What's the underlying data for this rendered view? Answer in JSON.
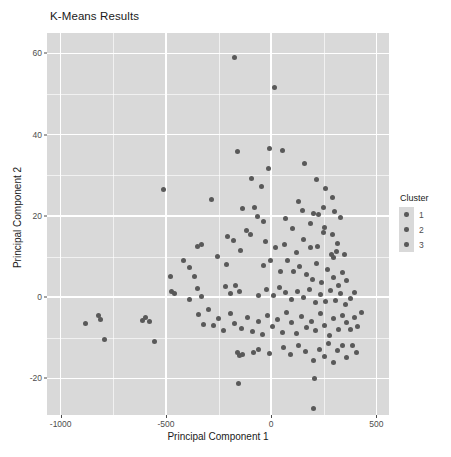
{
  "chart_data": {
    "type": "scatter",
    "title": "K-Means Results",
    "xlabel": "Principal Component 1",
    "ylabel": "Principal Component 2",
    "xlim": [
      -1065,
      560
    ],
    "ylim": [
      -29,
      65
    ],
    "x_ticks": [
      -1000,
      -500,
      0,
      500
    ],
    "x_tick_labels": [
      "-1000",
      "-500",
      "0",
      "500"
    ],
    "y_ticks": [
      -20,
      0,
      20,
      40,
      60
    ],
    "y_tick_labels": [
      "-20",
      "0",
      "20",
      "40",
      "60"
    ],
    "x_minor_ticks": [
      -750,
      -250,
      250
    ],
    "y_minor_ticks": [
      -10,
      10,
      30,
      50
    ],
    "grid": true,
    "legend_position": "right",
    "panel_background": "#d9d9d9",
    "grid_color": "#ffffff",
    "point_color": "#595959",
    "series": [
      {
        "name": "Cluster",
        "points": [
          [
            -172,
            59.0
          ],
          [
            15,
            51.5
          ],
          [
            -160,
            35.8
          ],
          [
            55,
            36.2
          ],
          [
            -7,
            36.6
          ],
          [
            -510,
            26.6
          ],
          [
            -283,
            24.0
          ],
          [
            -94,
            29.3
          ],
          [
            -48,
            27.3
          ],
          [
            -11,
            31.6
          ],
          [
            160,
            33.0
          ],
          [
            215,
            29.0
          ],
          [
            260,
            26.8
          ],
          [
            290,
            24.5
          ],
          [
            -77,
            22.0
          ],
          [
            -136,
            21.9
          ],
          [
            -65,
            19.8
          ],
          [
            -38,
            18.7
          ],
          [
            -100,
            15.5
          ],
          [
            68,
            19.4
          ],
          [
            100,
            17.0
          ],
          [
            147,
            21.2
          ],
          [
            202,
            20.5
          ],
          [
            225,
            20.3
          ],
          [
            255,
            17.2
          ],
          [
            292,
            15.3
          ],
          [
            315,
            13.1
          ],
          [
            330,
            19.5
          ],
          [
            -352,
            12.4
          ],
          [
            -330,
            12.9
          ],
          [
            -180,
            13.9
          ],
          [
            -145,
            11.5
          ],
          [
            -25,
            13.6
          ],
          [
            20,
            12.1
          ],
          [
            62,
            13.0
          ],
          [
            120,
            11.0
          ],
          [
            152,
            14.3
          ],
          [
            188,
            12.1
          ],
          [
            222,
            12.5
          ],
          [
            250,
            16.0
          ],
          [
            285,
            10.6
          ],
          [
            296,
            9.8
          ],
          [
            312,
            11.2
          ],
          [
            350,
            10.4
          ],
          [
            -415,
            9.1
          ],
          [
            -388,
            7.4
          ],
          [
            -362,
            5.2
          ],
          [
            -255,
            10.0
          ],
          [
            -210,
            8.1
          ],
          [
            -5,
            9.0
          ],
          [
            -35,
            7.7
          ],
          [
            45,
            6.4
          ],
          [
            80,
            8.9
          ],
          [
            108,
            6.2
          ],
          [
            133,
            7.5
          ],
          [
            170,
            5.6
          ],
          [
            195,
            4.4
          ],
          [
            215,
            8.2
          ],
          [
            240,
            3.5
          ],
          [
            268,
            6.7
          ],
          [
            295,
            4.9
          ],
          [
            318,
            2.9
          ],
          [
            340,
            6.0
          ],
          [
            358,
            4.1
          ],
          [
            -472,
            1.4
          ],
          [
            -458,
            0.9
          ],
          [
            -350,
            2.2
          ],
          [
            -330,
            0.1
          ],
          [
            -215,
            2.6
          ],
          [
            -192,
            0.9
          ],
          [
            -168,
            2.9
          ],
          [
            -150,
            1.5
          ],
          [
            -60,
            0.4
          ],
          [
            -20,
            1.9
          ],
          [
            10,
            0.3
          ],
          [
            40,
            2.4
          ],
          [
            70,
            1.1
          ],
          [
            95,
            -0.6
          ],
          [
            125,
            1.3
          ],
          [
            155,
            -0.2
          ],
          [
            180,
            2.0
          ],
          [
            210,
            -1.4
          ],
          [
            235,
            0.6
          ],
          [
            258,
            -1.0
          ],
          [
            280,
            1.7
          ],
          [
            305,
            -0.9
          ],
          [
            330,
            0.9
          ],
          [
            352,
            -1.8
          ],
          [
            375,
            -0.3
          ],
          [
            395,
            1.2
          ],
          [
            -880,
            -6.6
          ],
          [
            -820,
            -4.5
          ],
          [
            -812,
            -5.4
          ],
          [
            -790,
            -10.4
          ],
          [
            -612,
            -5.8
          ],
          [
            -595,
            -4.9
          ],
          [
            -580,
            -6.1
          ],
          [
            -552,
            -11.0
          ],
          [
            -345,
            -4.3
          ],
          [
            -322,
            -6.8
          ],
          [
            -300,
            -3.1
          ],
          [
            -275,
            -7.0
          ],
          [
            -250,
            -5.2
          ],
          [
            -225,
            -8.1
          ],
          [
            -195,
            -4.0
          ],
          [
            -172,
            -6.5
          ],
          [
            -140,
            -7.7
          ],
          [
            -112,
            -5.1
          ],
          [
            -88,
            -8.5
          ],
          [
            -62,
            -6.0
          ],
          [
            -40,
            -9.3
          ],
          [
            -15,
            -4.4
          ],
          [
            5,
            -7.2
          ],
          [
            28,
            -5.5
          ],
          [
            52,
            -8.8
          ],
          [
            75,
            -3.8
          ],
          [
            98,
            -6.3
          ],
          [
            120,
            -9.0
          ],
          [
            145,
            -4.7
          ],
          [
            168,
            -7.5
          ],
          [
            190,
            -5.9
          ],
          [
            212,
            -8.3
          ],
          [
            235,
            -4.1
          ],
          [
            255,
            -6.9
          ],
          [
            275,
            -9.5
          ],
          [
            298,
            -5.3
          ],
          [
            318,
            -7.9
          ],
          [
            338,
            -4.6
          ],
          [
            358,
            -6.2
          ],
          [
            378,
            -8.0
          ],
          [
            398,
            -5.0
          ],
          [
            412,
            -7.3
          ],
          [
            428,
            -3.9
          ],
          [
            -160,
            -13.6
          ],
          [
            -148,
            -14.4
          ],
          [
            -135,
            -14.1
          ],
          [
            -85,
            -13.5
          ],
          [
            -62,
            -13.0
          ],
          [
            -10,
            -13.8
          ],
          [
            60,
            -12.4
          ],
          [
            92,
            -14.0
          ],
          [
            130,
            -11.9
          ],
          [
            165,
            -13.3
          ],
          [
            200,
            -15.6
          ],
          [
            228,
            -12.8
          ],
          [
            252,
            -14.6
          ],
          [
            272,
            -11.5
          ],
          [
            295,
            -16.2
          ],
          [
            315,
            -13.1
          ],
          [
            338,
            -11.8
          ],
          [
            360,
            -14.8
          ],
          [
            385,
            -12.0
          ],
          [
            405,
            -13.5
          ],
          [
            -155,
            -21.2
          ],
          [
            205,
            -20.0
          ],
          [
            200,
            -27.3
          ],
          [
            -480,
            5.0
          ],
          [
            -205,
            14.9
          ],
          [
            -390,
            -0.6
          ],
          [
            -118,
            16.4
          ],
          [
            128,
            23.5
          ],
          [
            188,
            18.2
          ],
          [
            248,
            22.1
          ],
          [
            302,
            21.0
          ]
        ]
      }
    ]
  },
  "legend": {
    "title": "Cluster",
    "items": [
      {
        "label": "1"
      },
      {
        "label": "2"
      },
      {
        "label": "3"
      }
    ]
  }
}
